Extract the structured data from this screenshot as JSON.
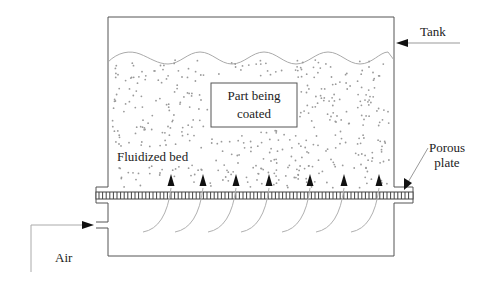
{
  "diagram": {
    "labels": {
      "tank": "Tank",
      "part_line1": "Part being",
      "part_line2": "coated",
      "fluidized_bed": "Fluidized bed",
      "porous_line1": "Porous",
      "porous_line2": "plate",
      "air": "Air"
    },
    "colors": {
      "outline": "#555555",
      "particles": "#9a9a9a",
      "wave": "#aaaaaa",
      "arrow": "#111111",
      "flow_curve": "#b0b0b0",
      "text": "#222222"
    },
    "air_flow_arrow_count": 7
  }
}
